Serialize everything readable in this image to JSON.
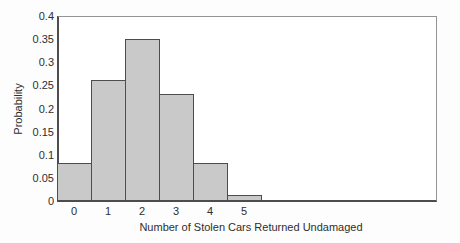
{
  "chart_data": {
    "type": "bar",
    "categories": [
      "0",
      "1",
      "2",
      "3",
      "4",
      "5"
    ],
    "values": [
      0.08,
      0.26,
      0.35,
      0.23,
      0.08,
      0.01
    ],
    "title": "",
    "xlabel": "Number of Stolen Cars Returned Undamaged",
    "ylabel": "Probability",
    "ylim": [
      0,
      0.4
    ],
    "yticks": [
      0,
      0.05,
      0.1,
      0.15,
      0.2,
      0.25,
      0.3,
      0.35,
      0.4
    ],
    "ytick_labels": [
      "0",
      "0.05",
      "0.1",
      "0.15",
      "0.2",
      "0.25",
      "0.3",
      "0.35",
      "0.4"
    ],
    "legend": null,
    "grid": false,
    "colors": {
      "bar_fill": "#c9c9c9",
      "bar_border": "#4d4d4d",
      "frame": "#949494",
      "axis": "#4d4d4d",
      "text": "#2e2e2e",
      "background": "#ffffff"
    }
  }
}
